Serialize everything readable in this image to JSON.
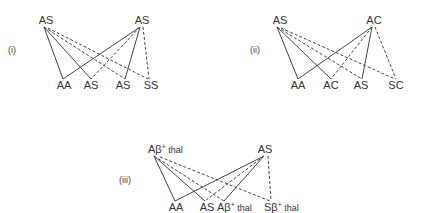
{
  "diagrams": [
    {
      "id": "i",
      "numeral": "(i)",
      "parents": [
        "AS",
        "AS"
      ],
      "children": [
        "AA",
        "AS",
        "AS",
        "SS"
      ]
    },
    {
      "id": "ii",
      "numeral": "(ii)",
      "parents": [
        "AS",
        "AC"
      ],
      "children": [
        "AA",
        "AC",
        "AS",
        "SC"
      ]
    },
    {
      "id": "iii",
      "numeral": "(iii)",
      "parents": [
        {
          "base": "Aβ",
          "sup": "+",
          "suffix": " thal"
        },
        {
          "base": "AS",
          "sup": "",
          "suffix": ""
        }
      ],
      "children": [
        {
          "base": "AA",
          "sup": "",
          "suffix": ""
        },
        {
          "base": "AS",
          "sup": "",
          "suffix": ""
        },
        {
          "base": "Aβ",
          "sup": "+",
          "suffix": " thal"
        },
        {
          "base": "Sβ",
          "sup": "+",
          "suffix": " thal"
        }
      ]
    }
  ],
  "colors": {
    "line": "#444444",
    "text": "#333333"
  }
}
